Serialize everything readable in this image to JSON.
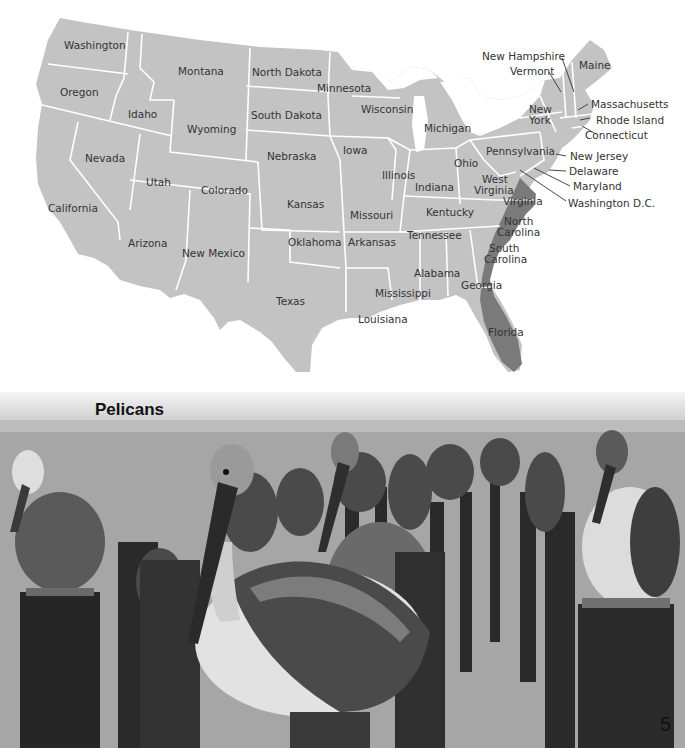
{
  "map": {
    "colors": {
      "land": "#c3c3c3",
      "border": "#ffffff",
      "highlight": "#7a7a7a",
      "label": "#333333"
    },
    "highlighted_range": [
      "Virginia",
      "North Carolina",
      "South Carolina",
      "Georgia (coast)",
      "Florida"
    ],
    "states": {
      "washington": "Washington",
      "oregon": "Oregon",
      "california": "California",
      "idaho": "Idaho",
      "nevada": "Nevada",
      "montana": "Montana",
      "wyoming": "Wyoming",
      "utah": "Utah",
      "arizona": "Arizona",
      "colorado": "Colorado",
      "new_mexico": "New Mexico",
      "north_dakota": "North Dakota",
      "south_dakota": "South Dakota",
      "nebraska": "Nebraska",
      "kansas": "Kansas",
      "oklahoma": "Oklahoma",
      "texas": "Texas",
      "minnesota": "Minnesota",
      "iowa": "Iowa",
      "missouri": "Missouri",
      "arkansas": "Arkansas",
      "louisiana": "Louisiana",
      "wisconsin": "Wisconsin",
      "illinois": "Illinois",
      "michigan": "Michigan",
      "indiana": "Indiana",
      "ohio": "Ohio",
      "kentucky": "Kentucky",
      "tennessee": "Tennessee",
      "mississippi": "Mississippi",
      "alabama": "Alabama",
      "georgia": "Georgia",
      "florida": "Florida",
      "south_carolina_1": "South",
      "south_carolina_2": "Carolina",
      "north_carolina_1": "North",
      "north_carolina_2": "Carolina",
      "virginia": "Virginia",
      "west_virginia_1": "West",
      "west_virginia_2": "Virginia",
      "pennsylvania": "Pennsylvania",
      "new_york_1": "New",
      "new_york_2": "York",
      "new_hampshire": "New Hampshire",
      "vermont": "Vermont",
      "maine": "Maine",
      "massachusetts": "Massachusetts",
      "rhode_island": "Rhode Island",
      "connecticut": "Connecticut",
      "new_jersey": "New Jersey",
      "delaware": "Delaware",
      "maryland": "Maryland",
      "washington_dc": "Washington D.C."
    }
  },
  "photo": {
    "title": "Pelicans",
    "page_number": "5"
  }
}
